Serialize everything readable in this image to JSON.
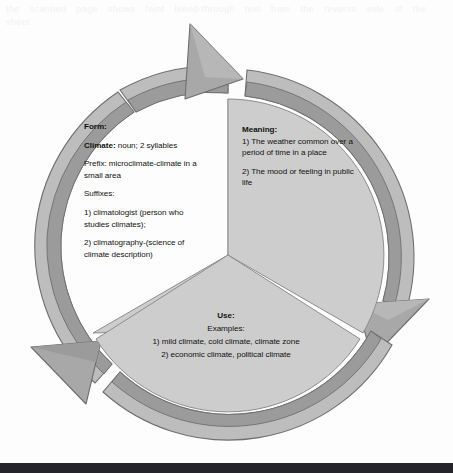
{
  "document": {
    "type": "word-study-cycle-diagram",
    "subject_word": "Climate",
    "ghost_text": "the scanned page shows faint bleed-through text from the reverse side of the sheet"
  },
  "colors": {
    "page_background": "#fdfdfd",
    "slice_fill": "#cdcdcd",
    "slice_outline": "#8d8d8d",
    "arrow_outer_band": "#bdbdbd",
    "arrow_inner_band": "#9b9b9b",
    "arrow_head": "#a8a8a8",
    "arrow_outline": "#6f6f6f",
    "text": "#12120f",
    "scan_bar": "#24242a"
  },
  "segments": [
    {
      "id": "form",
      "heading": "Form:",
      "paragraphs": [
        {
          "lead": "Climate:",
          "rest": " noun; 2 syllables"
        },
        {
          "lead": "",
          "rest": "Prefix: microclimate-climate in a small area"
        },
        {
          "lead": "",
          "rest": "Suffixes:"
        },
        {
          "lead": "",
          "rest": "1) climatologist (person who studies climates);"
        },
        {
          "lead": "",
          "rest": "2) climatography-(science of climate description)"
        }
      ]
    },
    {
      "id": "meaning",
      "heading": "Meaning:",
      "paragraphs": [
        {
          "lead": "",
          "rest": "1) The weather common over a period of time in a place"
        },
        {
          "lead": "",
          "rest": "2) The mood or feeling in public life"
        }
      ]
    },
    {
      "id": "use",
      "heading": "Use:",
      "paragraphs": [
        {
          "lead": "",
          "rest": "Examples:"
        },
        {
          "lead": "",
          "rest": "1) mild climate, cold climate, climate zone"
        },
        {
          "lead": "",
          "rest": "2) economic climate, political climate"
        }
      ]
    }
  ],
  "arrows": [
    {
      "id": "arrow-top",
      "direction": "clockwise",
      "points_to": "meaning"
    },
    {
      "id": "arrow-right",
      "direction": "clockwise",
      "points_to": "use"
    },
    {
      "id": "arrow-left",
      "direction": "clockwise",
      "points_to": "form"
    }
  ]
}
